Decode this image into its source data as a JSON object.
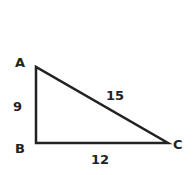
{
  "diagram": {
    "type": "right-triangle",
    "colors": {
      "stroke": "#222222",
      "background": "#ffffff"
    },
    "vertices": [
      {
        "label": "A",
        "x": 36,
        "y": 67
      },
      {
        "label": "B",
        "x": 36,
        "y": 143
      },
      {
        "label": "C",
        "x": 168,
        "y": 143
      }
    ],
    "sides": [
      {
        "between": "AB",
        "length": "9"
      },
      {
        "between": "AC",
        "length": "15"
      },
      {
        "between": "BC",
        "length": "12"
      }
    ]
  }
}
